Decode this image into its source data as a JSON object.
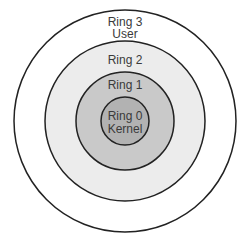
{
  "diagram": {
    "type": "concentric-rings",
    "center": [
      125,
      121
    ],
    "rings": [
      {
        "id": "ring3",
        "radius": 111,
        "fill": "#ffffff",
        "stroke": "#222222",
        "label": "Ring 3",
        "sublabel": "User"
      },
      {
        "id": "ring2",
        "radius": 80,
        "fill": "#ececec",
        "stroke": "#222222",
        "label": "Ring 2",
        "sublabel": ""
      },
      {
        "id": "ring1",
        "radius": 49,
        "fill": "#c9c9c9",
        "stroke": "#222222",
        "label": "Ring 1",
        "sublabel": ""
      },
      {
        "id": "ring0",
        "radius": 24,
        "fill": "#b2b2b2",
        "stroke": "#222222",
        "label": "Ring 0",
        "sublabel": "Kernel"
      }
    ]
  }
}
